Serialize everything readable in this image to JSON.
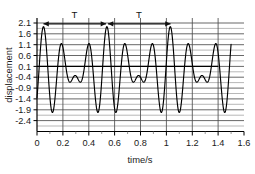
{
  "chart_data": {
    "type": "line",
    "title": "",
    "xlabel": "time/s",
    "ylabel": "displacement",
    "xlim": [
      0,
      1.6
    ],
    "ylim": [
      -2.4,
      2.1
    ],
    "grid": true,
    "legend": "none",
    "x_ticks": [
      "0",
      "0.2",
      "0.4",
      "0.6",
      "0.8",
      "1",
      "1.2",
      "1.4",
      "1.6"
    ],
    "x_tick_values": [
      0,
      0.2,
      0.4,
      0.6,
      0.8,
      1.0,
      1.2,
      1.4,
      1.6
    ],
    "y_ticks": [
      "2.1",
      "1.6",
      "1.1",
      "0.6",
      "0.1",
      "-0.4",
      "-0.9",
      "-1.4",
      "-1.9",
      "-2.4"
    ],
    "y_tick_values": [
      2.1,
      1.6,
      1.1,
      0.6,
      0.1,
      -0.4,
      -0.9,
      -1.4,
      -1.9,
      -2.4
    ],
    "y_minor_step": 0.25,
    "x_grid_step": 0.2,
    "baseline_value": 0.1,
    "series": [
      {
        "name": "displacement",
        "color": "#000000",
        "x_start": 0.0,
        "x_end": 1.5,
        "description": "Superposition of two sinusoids producing a repeating beat pattern of period 0.49 s",
        "components": [
          {
            "amplitude": 1.0,
            "frequency_hz": 6.12,
            "phase": 0.0,
            "offset": 0.1
          },
          {
            "amplitude": 0.85,
            "frequency_hz": 8.16,
            "phase": 0.0,
            "offset": 0.0
          }
        ],
        "peaks": [
          {
            "x": 0.05,
            "y": 1.85
          },
          {
            "x": 0.35,
            "y": 1.18
          },
          {
            "x": 0.545,
            "y": 1.85
          },
          {
            "x": 0.85,
            "y": 1.18
          },
          {
            "x": 1.035,
            "y": 1.85
          },
          {
            "x": 1.34,
            "y": 1.18
          }
        ],
        "troughs": [
          {
            "x": 0.14,
            "y": -1.12
          },
          {
            "x": 0.25,
            "y": -0.32
          },
          {
            "x": 0.465,
            "y": -1.85
          },
          {
            "x": 0.63,
            "y": -1.12
          },
          {
            "x": 0.74,
            "y": -0.32
          },
          {
            "x": 0.955,
            "y": -1.85
          },
          {
            "x": 1.12,
            "y": -1.12
          },
          {
            "x": 1.23,
            "y": -0.32
          },
          {
            "x": 1.445,
            "y": -1.85
          }
        ]
      }
    ],
    "annotations": [
      {
        "label": "T",
        "type": "period-span",
        "x_start": 0.05,
        "x_end": 0.545,
        "y": 1.85,
        "arrows": "both"
      },
      {
        "label": "T",
        "type": "period-span",
        "x_start": 0.55,
        "x_end": 1.035,
        "y": 1.85,
        "arrows": "both"
      }
    ]
  },
  "axes": {
    "x_axis_label": "time/s",
    "y_axis_label": "displacement"
  },
  "colors": {
    "curve": "#000000",
    "major_grid": "#555555",
    "minor_grid": "#9a9a9a",
    "axis": "#000000",
    "text": "#1a1a1a"
  }
}
